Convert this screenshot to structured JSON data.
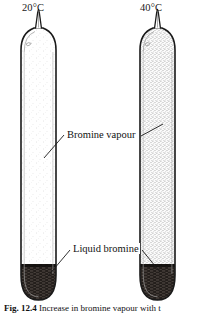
{
  "figure": {
    "caption_prefix": "Fig. 12.4",
    "caption_text": "Increase in bromine vapour with t",
    "labels": {
      "vapour": "Bromine vapour",
      "liquid": "Liquid bromine"
    },
    "tubes": [
      {
        "id": "left-tube",
        "temperature": "20°C",
        "vapour_density": "sparse",
        "liquid_present": true
      },
      {
        "id": "right-tube",
        "temperature": "40°C",
        "vapour_density": "dense",
        "liquid_present": true
      }
    ],
    "colors": {
      "glass_outline": "#1a1a1a",
      "liquid_bromine": "#231f1c",
      "vapour_light": "#e9e9e9",
      "vapour_dark": "#b9b9b9",
      "background": "#ffffff",
      "leader_line": "#1a1a1a"
    }
  }
}
